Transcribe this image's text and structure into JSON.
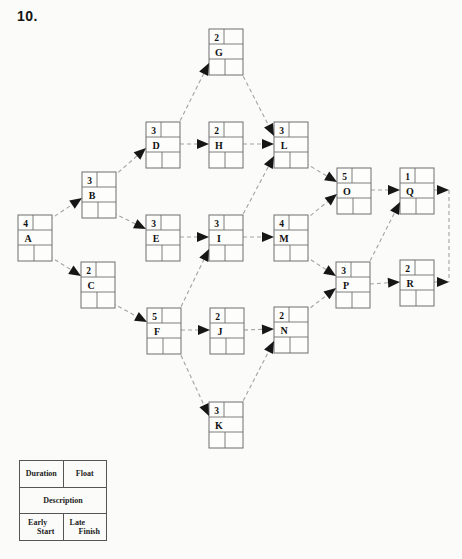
{
  "page": {
    "title": "10."
  },
  "legend": {
    "duration": "Duration",
    "float": "Float",
    "description": "Description",
    "early_start_line1": "Early",
    "early_start_line2": "Start",
    "late_finish_line1": "Late",
    "late_finish_line2": "Finish"
  },
  "colors": {
    "background": "#fbfbfa",
    "edge": "#a3a3a3",
    "box_border": "#6f6f6f",
    "arrowhead": "#161616",
    "text": "#111111"
  },
  "diagram": {
    "nodes": [
      {
        "id": "A",
        "duration": "4",
        "x": 18,
        "y": 215
      },
      {
        "id": "B",
        "duration": "3",
        "x": 82,
        "y": 172
      },
      {
        "id": "C",
        "duration": "2",
        "x": 81,
        "y": 262
      },
      {
        "id": "D",
        "duration": "3",
        "x": 146,
        "y": 122
      },
      {
        "id": "E",
        "duration": "3",
        "x": 146,
        "y": 215
      },
      {
        "id": "F",
        "duration": "5",
        "x": 147,
        "y": 308
      },
      {
        "id": "G",
        "duration": "2",
        "x": 209,
        "y": 29
      },
      {
        "id": "H",
        "duration": "2",
        "x": 209,
        "y": 122
      },
      {
        "id": "I",
        "duration": "3",
        "x": 209,
        "y": 215
      },
      {
        "id": "J",
        "duration": "2",
        "x": 210,
        "y": 308
      },
      {
        "id": "K",
        "duration": "3",
        "x": 209,
        "y": 402
      },
      {
        "id": "L",
        "duration": "3",
        "x": 274,
        "y": 122
      },
      {
        "id": "M",
        "duration": "4",
        "x": 274,
        "y": 215
      },
      {
        "id": "N",
        "duration": "2",
        "x": 274,
        "y": 307
      },
      {
        "id": "O",
        "duration": "5",
        "x": 337,
        "y": 168
      },
      {
        "id": "P",
        "duration": "3",
        "x": 336,
        "y": 262
      },
      {
        "id": "Q",
        "duration": "1",
        "x": 400,
        "y": 168
      },
      {
        "id": "R",
        "duration": "2",
        "x": 400,
        "y": 260
      }
    ],
    "edges": [
      {
        "from": "A",
        "to": "B"
      },
      {
        "from": "A",
        "to": "C"
      },
      {
        "from": "B",
        "to": "D"
      },
      {
        "from": "B",
        "to": "E"
      },
      {
        "from": "C",
        "to": "F"
      },
      {
        "from": "D",
        "to": "G"
      },
      {
        "from": "D",
        "to": "H"
      },
      {
        "from": "E",
        "to": "I"
      },
      {
        "from": "F",
        "to": "I"
      },
      {
        "from": "F",
        "to": "J"
      },
      {
        "from": "F",
        "to": "K"
      },
      {
        "from": "G",
        "to": "L"
      },
      {
        "from": "H",
        "to": "L"
      },
      {
        "from": "I",
        "to": "L"
      },
      {
        "from": "I",
        "to": "M"
      },
      {
        "from": "J",
        "to": "N"
      },
      {
        "from": "K",
        "to": "N"
      },
      {
        "from": "L",
        "to": "O"
      },
      {
        "from": "M",
        "to": "O"
      },
      {
        "from": "M",
        "to": "P"
      },
      {
        "from": "N",
        "to": "P"
      },
      {
        "from": "O",
        "to": "Q"
      },
      {
        "from": "P",
        "to": "Q"
      },
      {
        "from": "P",
        "to": "R"
      }
    ],
    "end_arrows": [
      {
        "from": "Q",
        "tip_x": 449,
        "tip_y": 190
      },
      {
        "from": "R",
        "tip_x": 449,
        "tip_y": 282
      }
    ],
    "finish_connector": {
      "x": 449,
      "y1": 190,
      "y2": 282
    }
  }
}
